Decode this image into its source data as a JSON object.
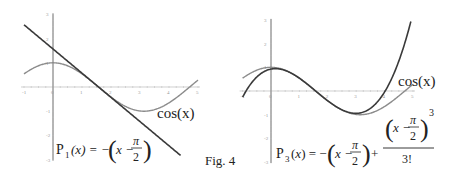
{
  "caption": "Fig. 4",
  "chart_data": [
    {
      "type": "line",
      "title": "",
      "xlabel": "",
      "ylabel": "",
      "xlim": [
        -1,
        5
      ],
      "ylim": [
        -3,
        3
      ],
      "x_ticks": [
        "-1",
        "0",
        "1",
        "2",
        "3",
        "4",
        "5"
      ],
      "y_ticks": [
        "-3",
        "-2",
        "-1",
        "1",
        "2",
        "3"
      ],
      "grid": false,
      "series": [
        {
          "name": "cos(x)",
          "expression": "cos(x)",
          "color": "#8c8c8c",
          "x": [
            -1,
            -0.5,
            0,
            0.5,
            1,
            1.5708,
            2,
            2.5,
            3,
            3.1416,
            3.5,
            4,
            4.5,
            5
          ],
          "values": [
            0.54,
            0.878,
            1,
            0.878,
            0.54,
            0,
            -0.416,
            -0.801,
            -0.99,
            -1,
            -0.936,
            -0.654,
            -0.211,
            0.284
          ]
        },
        {
          "name": "P1(x) = -(x - π/2)",
          "expression": "-(x - pi/2)",
          "color": "#3a3a3a",
          "x": [
            -1,
            0,
            1,
            1.5708,
            2,
            3,
            4,
            4.4
          ],
          "values": [
            2.571,
            1.571,
            0.571,
            0,
            -0.429,
            -1.429,
            -2.429,
            -2.829
          ]
        }
      ],
      "annotations": [
        "cos(x)",
        "P1(x) = -(x - π/2)"
      ]
    },
    {
      "type": "line",
      "title": "",
      "xlabel": "",
      "ylabel": "",
      "xlim": [
        -1,
        5
      ],
      "ylim": [
        -3,
        3
      ],
      "x_ticks": [
        "-1",
        "0",
        "1",
        "2",
        "3",
        "4",
        "5"
      ],
      "y_ticks": [
        "-3",
        "-2",
        "-1",
        "1",
        "2",
        "3"
      ],
      "grid": false,
      "series": [
        {
          "name": "cos(x)",
          "expression": "cos(x)",
          "color": "#8c8c8c",
          "x": [
            -1,
            -0.5,
            0,
            0.5,
            1,
            1.5708,
            2,
            2.5,
            3,
            3.1416,
            3.5,
            4,
            4.5,
            5
          ],
          "values": [
            0.54,
            0.878,
            1,
            0.878,
            0.54,
            0,
            -0.416,
            -0.801,
            -0.99,
            -1,
            -0.936,
            -0.654,
            -0.211,
            0.284
          ]
        },
        {
          "name": "P3(x) = -(x - π/2) + (x - π/2)^3/3!",
          "expression": "-(x - pi/2) + (x - pi/2)^3/6",
          "color": "#3a3a3a",
          "x": [
            -1,
            0,
            1,
            1.5708,
            2,
            3,
            3.5,
            4,
            4.5,
            5
          ],
          "values": [
            -0.258,
            0.925,
            0.54,
            0,
            -0.416,
            -0.942,
            -0.73,
            -0.037,
            1.258,
            3.29
          ]
        }
      ],
      "annotations": [
        "cos(x)",
        "P3(x) = -(x - π/2) + (x - π/2)^3 / 3!"
      ]
    }
  ],
  "labels": {
    "left_cos": "cos(x)",
    "right_cos": "cos(x)",
    "left_formula_lhs": "P",
    "left_formula_sub": "1",
    "left_formula_arg": "(x) = −",
    "right_formula_lhs": "P",
    "right_formula_sub": "3",
    "right_formula_arg": "(x) = −",
    "x_var": "x",
    "minus": "−",
    "plus": "+",
    "pi": "π",
    "two": "2",
    "cube": "3",
    "factorial": "3!"
  }
}
